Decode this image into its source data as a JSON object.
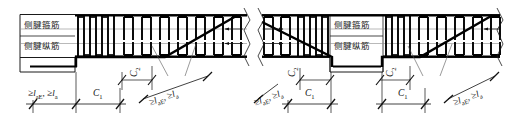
{
  "drawing": {
    "title": "侧腱配筋构造详图",
    "panels": [
      {
        "id": "left-panel",
        "labels": {
          "stirrup": "侧腱箍筋",
          "longitudinal": "侧腱纵筋"
        },
        "dimensions": [
          {
            "id": "anchor-left",
            "text": "≥l",
            "sub1": "aE",
            "sep": ", ",
            "text2": "≥l",
            "sub2": "a"
          },
          {
            "id": "c1",
            "text": "C",
            "sub1": "1"
          },
          {
            "id": "c2",
            "text": "C",
            "sub1": "2"
          },
          {
            "id": "anchor-diagonal",
            "text": "≥l",
            "sub1": "aE",
            "sep": ", ",
            "text2": "≥l",
            "sub2": "a"
          }
        ]
      },
      {
        "id": "right-panel",
        "labels": {
          "stirrup": "侧腱箍筋",
          "longitudinal": "侧腱纵筋"
        },
        "dimensions": [
          {
            "id": "anchor-left",
            "text": "≥l",
            "sub1": "aE",
            "sep": ", ",
            "text2": "≥l",
            "sub2": "a"
          },
          {
            "id": "c1-left",
            "text": "C",
            "sub1": "1"
          },
          {
            "id": "c2-left",
            "text": "C",
            "sub1": "2"
          },
          {
            "id": "c1-right",
            "text": "C",
            "sub1": "1"
          },
          {
            "id": "c2-right",
            "text": "C",
            "sub1": "2"
          },
          {
            "id": "anchor-diagonal",
            "text": "≥l",
            "sub1": "aE",
            "sep": ", ",
            "text2": "≥l",
            "sub2": "a"
          }
        ]
      }
    ],
    "text": {
      "ge": "≥",
      "l": "l",
      "sub_aE": "aE",
      "sub_a": "a",
      "comma": ",",
      "C": "C",
      "sub_1": "1",
      "sub_2": "2",
      "stirrup_label": "侧腱箍筋",
      "longitudinal_label": "侧腱纵筋",
      "anchor_label": "≥l aE , ≥l a"
    },
    "colors": {
      "line": "#1a1a1a",
      "rebar": "#000000",
      "thin": "#555555",
      "background": "#ffffff"
    }
  }
}
